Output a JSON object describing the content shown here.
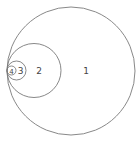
{
  "diagram": {
    "type": "nested-tangent-circles",
    "stroke_color": "#7a7a7a",
    "circles": [
      {
        "label": "1",
        "cx": 71,
        "cy": 71,
        "r": 64,
        "label_x": 86,
        "label_y": 74
      },
      {
        "label": "2",
        "cx": 34,
        "cy": 70.5,
        "r": 27,
        "label_x": 39,
        "label_y": 74
      },
      {
        "label": "3",
        "cx": 16.5,
        "cy": 70.5,
        "r": 9.5,
        "label_x": 20.5,
        "label_y": 74
      },
      {
        "label": "4",
        "cx": 11.5,
        "cy": 70.5,
        "r": 4.5,
        "label_x": 11.5,
        "label_y": 74
      }
    ]
  }
}
